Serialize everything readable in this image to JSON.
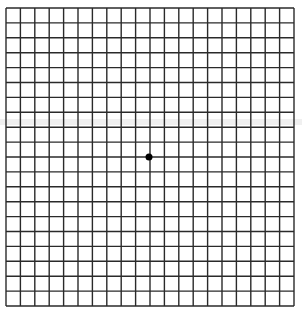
{
  "grid": {
    "columns": 20,
    "rows": 20,
    "left": 6,
    "top": 8,
    "right": 294,
    "bottom": 306,
    "line_color": "#2a2a2a",
    "line_width": 1.4,
    "background": "#ffffff"
  },
  "fixation_dot": {
    "cx": 149,
    "cy": 157,
    "r": 3.5,
    "color": "#000000"
  },
  "artifacts": [
    {
      "type": "band",
      "y": 122,
      "height": 6,
      "color": "#e6e6e6"
    }
  ]
}
